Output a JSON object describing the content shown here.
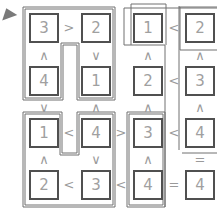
{
  "puzzle": {
    "type": "futoshiki-killer",
    "grid": [
      [
        "3",
        "2",
        "1",
        "2"
      ],
      [
        "4",
        "1",
        "2",
        "3"
      ],
      [
        "1",
        "4",
        "3",
        "4"
      ],
      [
        "2",
        "3",
        "4",
        "4"
      ]
    ],
    "horizontal_constraints": [
      [
        ">",
        "",
        "<"
      ],
      [
        "",
        "",
        "<"
      ],
      [
        "<",
        ">",
        "<"
      ],
      [
        "<",
        "<",
        "="
      ]
    ],
    "vertical_constraints": [
      [
        "∧",
        "∨",
        "∧",
        "∧"
      ],
      [
        "∨",
        "∧",
        "∧",
        "∧"
      ],
      [
        "∧",
        "∨",
        "∧",
        "="
      ]
    ]
  },
  "cursor": {
    "icon": "pointer-icon"
  }
}
